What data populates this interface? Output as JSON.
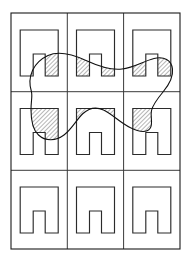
{
  "figure": {
    "title": "Three-by-three grid of arch cells overlaid by a closed region curve",
    "background_color": "#ffffff",
    "line_color": "#1a1a1a",
    "grid_line_color": "#3a3a3a",
    "curve_color": "#111111",
    "hatch_color": "#3c3c3c",
    "frame": {
      "x": 11,
      "y": 13,
      "width": 169,
      "height": 236,
      "stroke_width": 1.1
    },
    "grid": {
      "rows": 3,
      "columns": 3,
      "column_edges": [
        11,
        67.3,
        123.6,
        180
      ],
      "row_edges": [
        13,
        91.7,
        170.3,
        249
      ],
      "cell_width": 56.3,
      "cell_height": 78.7
    },
    "arch": {
      "icon_name": "arch-doorway-shape",
      "outer_width": 38,
      "outer_height": 46,
      "notch_width": 12,
      "notch_height": 22,
      "stroke_width": 1.15,
      "description": "Rectangle outline with an inverted-U (n-shaped) notch cut out of the bottom centre"
    },
    "cells": [
      {
        "id": "cell-r1c1",
        "row": 1,
        "col": 1,
        "label": "top-left",
        "arch_center_x": 39.2,
        "arch_top_y": 30,
        "hatched": true,
        "hatch_regions": [
          "right-pier-lower"
        ]
      },
      {
        "id": "cell-r1c2",
        "row": 1,
        "col": 2,
        "label": "top-middle",
        "arch_center_x": 95.5,
        "arch_top_y": 30,
        "hatched": true,
        "hatch_regions": [
          "left-pier-lower",
          "right-pier-lower"
        ]
      },
      {
        "id": "cell-r1c3",
        "row": 1,
        "col": 3,
        "label": "top-right",
        "arch_center_x": 151.8,
        "arch_top_y": 30,
        "hatched": true,
        "hatch_regions": [
          "left-pier-lower",
          "right-pier-lower"
        ]
      },
      {
        "id": "cell-r2c1",
        "row": 2,
        "col": 1,
        "label": "middle-left",
        "arch_center_x": 39.2,
        "arch_top_y": 108.5,
        "hatched": true,
        "hatch_regions": [
          "upper-band-full"
        ]
      },
      {
        "id": "cell-r2c2",
        "row": 2,
        "col": 2,
        "label": "middle-centre",
        "arch_center_x": 95.5,
        "arch_top_y": 108.5,
        "hatched": true,
        "hatch_regions": [
          "upper-band-left-wedge"
        ]
      },
      {
        "id": "cell-r2c3",
        "row": 2,
        "col": 3,
        "label": "middle-right",
        "arch_center_x": 151.8,
        "arch_top_y": 108.5,
        "hatched": true,
        "hatch_regions": [
          "upper-band-right-wedge"
        ]
      },
      {
        "id": "cell-r3c1",
        "row": 3,
        "col": 1,
        "label": "bottom-left",
        "arch_center_x": 39.2,
        "arch_top_y": 187,
        "hatched": false,
        "hatch_regions": []
      },
      {
        "id": "cell-r3c2",
        "row": 3,
        "col": 2,
        "label": "bottom-middle",
        "arch_center_x": 95.5,
        "arch_top_y": 187,
        "hatched": false,
        "hatch_regions": []
      },
      {
        "id": "cell-r3c3",
        "row": 3,
        "col": 3,
        "label": "bottom-right",
        "arch_center_x": 151.8,
        "arch_top_y": 187,
        "hatched": false,
        "hatch_regions": []
      }
    ],
    "curve": {
      "name": "closed-region-curve",
      "closed": true,
      "spans_rows": [
        1,
        2
      ],
      "bounding_box": {
        "x": 25,
        "y": 52,
        "width": 148,
        "height": 89
      },
      "path": "M 31.5 92 C 26.5 76 34 62 48 55.5 C 60 50 74 55 86 60.5 C 98 66 110 70.5 122 69 C 134 67.5 144 61 154 58.5 C 164 56 171.5 60 172.5 69 C 173.5 78 168 86 163 92 C 158 98 153 104 151.5 110.5 C 150 117 153.5 124 150 128.5 C 146 133.5 137 131 130 127.5 C 120 122.5 112 114 103.5 110 C 96 106.5 89 108 83 113.5 C 76.5 119.5 72 129 64 135 C 56 141 45.5 141.5 38.5 135 C 32 129 31 119 31 110 C 31 101.5 32.5 96.5 31.5 92 Z"
    },
    "hatching": {
      "angle_degrees": 45,
      "spacing_px": 3,
      "stroke_width": 0.75,
      "color": "#3c3c3c"
    }
  }
}
